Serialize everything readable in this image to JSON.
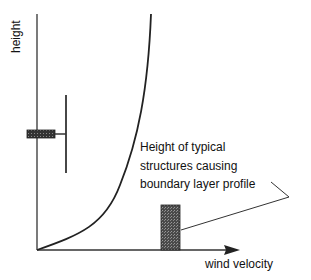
{
  "axes": {
    "y_label": "height",
    "x_label": "wind velocity"
  },
  "annotation": {
    "lines": [
      "Height of typical",
      "structures causing",
      "boundary layer profile"
    ]
  },
  "colors": {
    "line": "#222222",
    "bar_fill": "#555555",
    "background": "#ffffff"
  }
}
